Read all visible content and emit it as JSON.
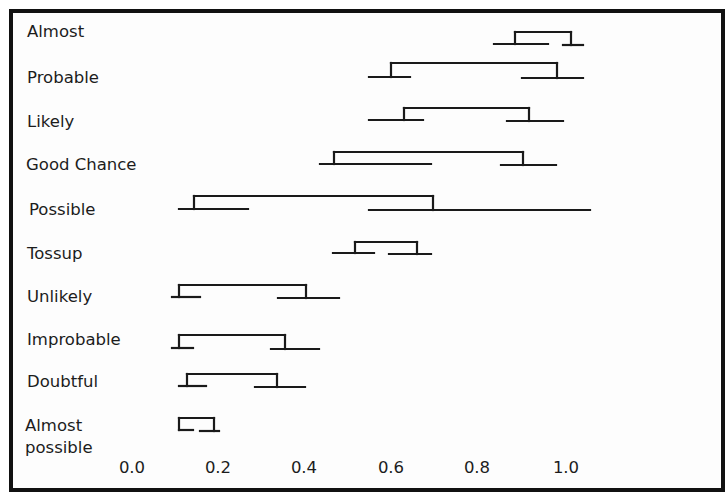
{
  "chart_data": {
    "type": "range-bracket",
    "title": "",
    "xlabel": "",
    "ylabel": "",
    "xlim": [
      0.0,
      1.0
    ],
    "x_ticks": [
      "0.0",
      "0.2",
      "0.4",
      "0.6",
      "0.8",
      "1.0"
    ],
    "grid": false,
    "legend": null,
    "categories": [
      "Almost",
      "Probable",
      "Likely",
      "Good Chance",
      "Possible",
      "Tossup",
      "Unlikely",
      "Improbable",
      "Doubtful",
      "Almost possible"
    ],
    "series": [
      {
        "name": "Almost",
        "left_whisker": [
          0.83,
          0.96
        ],
        "bracket": [
          0.88,
          1.01
        ],
        "right_whisker": [
          0.99,
          1.04
        ]
      },
      {
        "name": "Probable",
        "left_whisker": [
          0.54,
          0.64
        ],
        "bracket": [
          0.59,
          0.98
        ],
        "right_whisker": [
          0.9,
          1.04
        ]
      },
      {
        "name": "Likely",
        "left_whisker": [
          0.54,
          0.67
        ],
        "bracket": [
          0.62,
          0.91
        ],
        "right_whisker": [
          0.86,
          0.99
        ]
      },
      {
        "name": "Good Chance",
        "left_whisker": [
          0.43,
          0.69
        ],
        "bracket": [
          0.46,
          0.9
        ],
        "right_whisker": [
          0.85,
          0.97
        ]
      },
      {
        "name": "Possible",
        "left_whisker": [
          0.11,
          0.27
        ],
        "bracket": [
          0.14,
          0.69
        ],
        "right_whisker": [
          0.54,
          1.05
        ]
      },
      {
        "name": "Tossup",
        "left_whisker": [
          0.46,
          0.56
        ],
        "bracket": [
          0.51,
          0.66
        ],
        "right_whisker": [
          0.59,
          0.69
        ]
      },
      {
        "name": "Unlikely",
        "left_whisker": [
          0.09,
          0.16
        ],
        "bracket": [
          0.11,
          0.4
        ],
        "right_whisker": [
          0.34,
          0.48
        ]
      },
      {
        "name": "Improbable",
        "left_whisker": [
          0.09,
          0.14
        ],
        "bracket": [
          0.11,
          0.35
        ],
        "right_whisker": [
          0.32,
          0.43
        ]
      },
      {
        "name": "Doubtful",
        "left_whisker": [
          0.11,
          0.17
        ],
        "bracket": [
          0.13,
          0.33
        ],
        "right_whisker": [
          0.28,
          0.4
        ]
      },
      {
        "name": "Almost possible",
        "left_whisker": [
          0.11,
          0.14
        ],
        "bracket": [
          0.11,
          0.19
        ],
        "right_whisker": [
          0.16,
          0.2
        ]
      }
    ]
  },
  "labels": {
    "rows": [
      {
        "text": "Almost",
        "x": 27,
        "y": 22
      },
      {
        "text": "Probable",
        "x": 27,
        "y": 68
      },
      {
        "text": "Likely",
        "x": 27,
        "y": 112
      },
      {
        "text": "Good Chance",
        "x": 26,
        "y": 155
      },
      {
        "text": "Possible",
        "x": 29,
        "y": 200
      },
      {
        "text": "Tossup",
        "x": 27,
        "y": 244
      },
      {
        "text": "Unlikely",
        "x": 27,
        "y": 287
      },
      {
        "text": "Improbable",
        "x": 27,
        "y": 330
      },
      {
        "text": "Doubtful",
        "x": 27,
        "y": 372
      },
      {
        "text": "Almost",
        "x": 25,
        "y": 416
      },
      {
        "text": "possible",
        "x": 25,
        "y": 438
      }
    ]
  },
  "axis": {
    "ticks": [
      {
        "text": "0.0",
        "x": 132
      },
      {
        "text": "0.2",
        "x": 218
      },
      {
        "text": "0.4",
        "x": 304
      },
      {
        "text": "0.6",
        "x": 391
      },
      {
        "text": "0.8",
        "x": 477
      },
      {
        "text": "1.0",
        "x": 566
      }
    ],
    "tick_label_y": 458
  },
  "geometry": {
    "stroke_color": "#1a1a1a",
    "rows": [
      {
        "base_y": 44,
        "top_y": 32,
        "lw": [
          494,
          548
        ],
        "br": [
          515,
          571
        ],
        "rw": [
          563,
          583
        ]
      },
      {
        "base_y": 77,
        "top_y": 63,
        "lw": [
          369,
          410
        ],
        "br": [
          391,
          557
        ],
        "rw": [
          522,
          583
        ]
      },
      {
        "base_y": 120,
        "top_y": 108,
        "lw": [
          369,
          423
        ],
        "br": [
          404,
          529
        ],
        "rw": [
          507,
          563
        ]
      },
      {
        "base_y": 164,
        "top_y": 152,
        "lw": [
          320,
          431
        ],
        "br": [
          334,
          523
        ],
        "rw": [
          501,
          556
        ]
      },
      {
        "base_y": 209,
        "top_y": 196,
        "lw": [
          179,
          248
        ],
        "br": [
          194,
          433
        ],
        "rw": [
          369,
          590
        ]
      },
      {
        "base_y": 253,
        "top_y": 242,
        "lw": [
          333,
          374
        ],
        "br": [
          355,
          417
        ],
        "rw": [
          389,
          431
        ]
      },
      {
        "base_y": 297,
        "top_y": 285,
        "lw": [
          172,
          200
        ],
        "br": [
          179,
          306
        ],
        "rw": [
          278,
          339
        ]
      },
      {
        "base_y": 348,
        "top_y": 335,
        "lw": [
          172,
          193
        ],
        "br": [
          179,
          285
        ],
        "rw": [
          271,
          319
        ]
      },
      {
        "base_y": 386,
        "top_y": 374,
        "lw": [
          179,
          206
        ],
        "br": [
          187,
          277
        ],
        "rw": [
          255,
          305
        ]
      },
      {
        "base_y": 430,
        "top_y": 418,
        "lw": [
          179,
          193
        ],
        "br": [
          179,
          214
        ],
        "rw": [
          200,
          219
        ]
      }
    ]
  }
}
